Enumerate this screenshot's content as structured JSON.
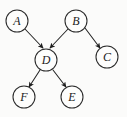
{
  "figure": {
    "kind": "directed-graph-diagram",
    "caption": "",
    "width": 127,
    "height": 117,
    "background_color": "#fbfbfa",
    "ink_color": "#242424",
    "node_fill_color": "#fdfdfc"
  },
  "nodes": [
    {
      "id": "A",
      "label": "A",
      "cx": 17,
      "cy": 21,
      "r": 11
    },
    {
      "id": "B",
      "label": "B",
      "cx": 76,
      "cy": 21,
      "r": 11
    },
    {
      "id": "C",
      "label": "C",
      "cx": 107,
      "cy": 57,
      "r": 11
    },
    {
      "id": "D",
      "label": "D",
      "cx": 46,
      "cy": 60,
      "r": 11
    },
    {
      "id": "E",
      "label": "E",
      "cx": 72,
      "cy": 97,
      "r": 11
    },
    {
      "id": "F",
      "label": "F",
      "cx": 24,
      "cy": 97,
      "r": 11
    }
  ],
  "edges": [
    {
      "id": "A-D",
      "from": "A",
      "to": "D",
      "directed": true,
      "x1": 25,
      "y1": 29,
      "x2": 43,
      "y2": 48
    },
    {
      "id": "B-D",
      "from": "B",
      "to": "D",
      "directed": true,
      "x1": 68,
      "y1": 29,
      "x2": 50,
      "y2": 48
    },
    {
      "id": "B-C",
      "from": "B",
      "to": "C",
      "directed": true,
      "x1": 85,
      "y1": 28,
      "x2": 100,
      "y2": 48
    },
    {
      "id": "D-F",
      "from": "D",
      "to": "F",
      "directed": true,
      "x1": 40,
      "y1": 70,
      "x2": 29,
      "y2": 87
    },
    {
      "id": "D-E",
      "from": "D",
      "to": "E",
      "directed": true,
      "x1": 53,
      "y1": 70,
      "x2": 66,
      "y2": 87
    }
  ],
  "bleed_through_text": "的究研向偏 问题的研究 某 题间 向偏 的 \n研究 方 的题间 向偏 时 \n之 用应 的 中其 回 文相 的 关 \n间 题 的 究 研 向偏 之 用 应 \n究 研 的 偏 向 问 题 一 的 \n题 问 的 究 研 向 偏 时 其"
}
